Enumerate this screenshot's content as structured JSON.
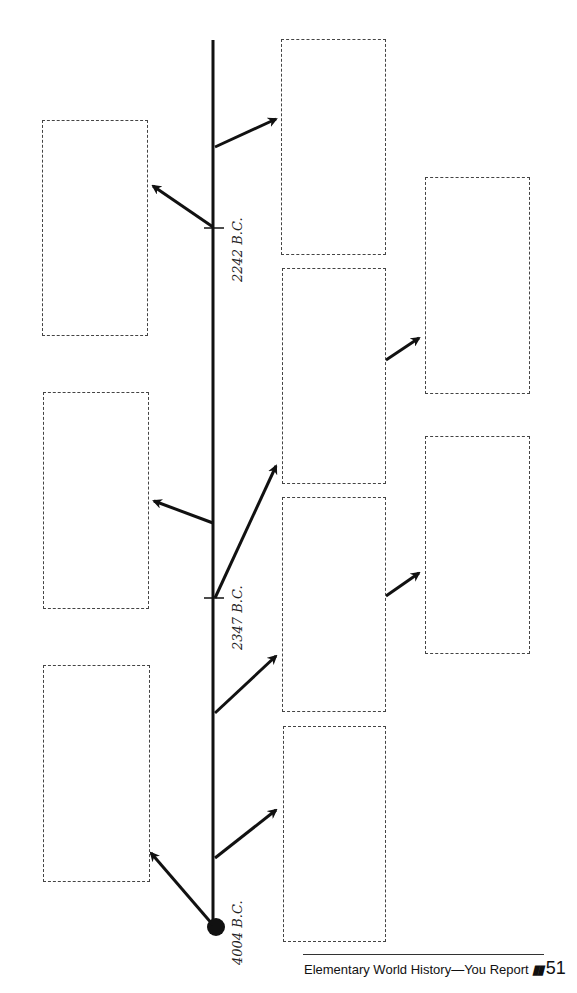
{
  "timeline": {
    "dates": [
      {
        "label": "4004 B.C.",
        "y": 927
      },
      {
        "label": "2347 B.C.",
        "y": 598
      },
      {
        "label": "2242 B.C.",
        "y": 228
      }
    ]
  },
  "footer": {
    "title": "Elementary World History—You Report",
    "marks": "▮▮",
    "page": "51"
  },
  "colors": {
    "line": "#111111",
    "box_border": "#444444"
  }
}
